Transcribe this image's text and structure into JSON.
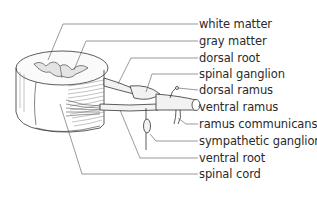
{
  "diagram": {
    "labels": [
      {
        "id": "white-matter",
        "text": "white matter",
        "y": 18
      },
      {
        "id": "gray-matter",
        "text": "gray matter",
        "y": 35
      },
      {
        "id": "dorsal-root",
        "text": "dorsal root",
        "y": 52
      },
      {
        "id": "spinal-ganglion",
        "text": "spinal ganglion",
        "y": 68
      },
      {
        "id": "dorsal-ramus",
        "text": "dorsal ramus",
        "y": 84
      },
      {
        "id": "ventral-ramus",
        "text": "ventral ramus",
        "y": 101
      },
      {
        "id": "ramus-communicans",
        "text": "ramus communicans",
        "y": 118
      },
      {
        "id": "sympathetic-ganglion",
        "text": "sympathetic ganglion",
        "y": 135
      },
      {
        "id": "ventral-root",
        "text": "ventral root",
        "y": 152
      },
      {
        "id": "spinal-cord",
        "text": "spinal cord",
        "y": 168
      }
    ],
    "colors": {
      "ink": "#2a2a2a",
      "line": "#555555",
      "background": "#ffffff"
    }
  }
}
